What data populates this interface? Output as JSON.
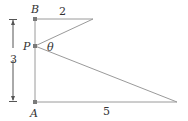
{
  "diagram": {
    "points": {
      "A": {
        "label": "A",
        "x": 35,
        "y": 102
      },
      "B": {
        "label": "B",
        "x": 35,
        "y": 19
      },
      "P": {
        "label": "P",
        "x": 35,
        "y": 46
      },
      "top_end": {
        "x": 93,
        "y": 19
      },
      "right_end": {
        "x": 177,
        "y": 102
      }
    },
    "labels": {
      "A": "A",
      "B": "B",
      "P": "P",
      "theta": "θ",
      "top_length": "2",
      "bottom_length": "5",
      "height": "3"
    },
    "colors": {
      "line": "#9a9a9a",
      "point": "#7a7a7a",
      "text": "#333333"
    }
  }
}
